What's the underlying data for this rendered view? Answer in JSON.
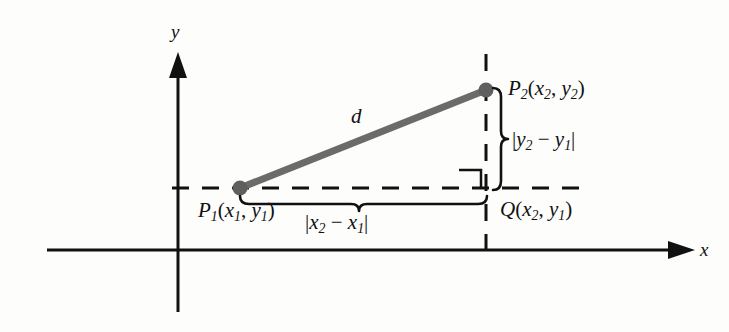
{
  "figure": {
    "background_color": "#fdfdfc",
    "ink_color": "#111111",
    "segment_color": "#6b6b6b",
    "axes": {
      "x_axis_label": "x",
      "y_axis_label": "y",
      "x_axis_y_px": 250,
      "y_axis_x_px": 178
    },
    "labels": {
      "distance": "d",
      "point_1": {
        "name": "P",
        "sub": "1",
        "coords_open": "(",
        "cx": "x",
        "cx_sub": "1",
        "comma": ", ",
        "cy": "y",
        "cy_sub": "1",
        "coords_close": ")"
      },
      "point_2": {
        "name": "P",
        "sub": "2",
        "coords_open": "(",
        "cx": "x",
        "cx_sub": "2",
        "comma": ", ",
        "cy": "y",
        "cy_sub": "2",
        "coords_close": ")"
      },
      "point_q": {
        "name": "Q",
        "coords_open": "(",
        "cx": "x",
        "cx_sub": "2",
        "comma": ", ",
        "cy": "y",
        "cy_sub": "1",
        "coords_close": ")"
      },
      "delta_y": {
        "bar_open": "|",
        "a": "y",
        "a_sub": "2",
        "minus": " − ",
        "b": "y",
        "b_sub": "1",
        "bar_close": "|"
      },
      "delta_x": {
        "bar_open": "|",
        "a": "x",
        "a_sub": "2",
        "minus": " − ",
        "b": "x",
        "b_sub": "1",
        "bar_close": "|"
      }
    },
    "geometry": {
      "p1_px": [
        240,
        188
      ],
      "p2_px": [
        486,
        90
      ],
      "q_px": [
        486,
        188
      ],
      "segment_width_px": 7,
      "dot_radius_px": 7,
      "right_angle_marker": true
    }
  }
}
